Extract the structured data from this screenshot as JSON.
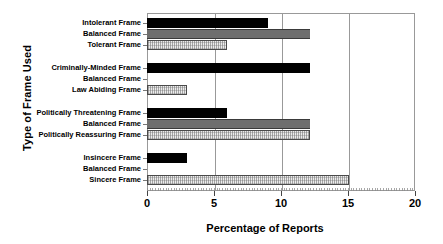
{
  "chart_data": {
    "type": "bar",
    "orientation": "horizontal",
    "title": "",
    "xlabel": "Percentage of Reports",
    "ylabel": "Type of Frame Used",
    "xlim": [
      0,
      20
    ],
    "xticks": [
      0,
      5,
      10,
      15,
      20
    ],
    "xtick_labels": [
      "0",
      "5",
      "10",
      "15",
      "20"
    ],
    "grid": true,
    "grid_axis": "x",
    "legend": "none",
    "categories": [
      "Intolerant Frame",
      "Balanced Frame",
      "Tolerant Frame",
      "Criminally-Minded Frame",
      "Balanced Frame",
      "Law Abiding Frame",
      "Politically Threatening Frame",
      "Balanced Frame",
      "Politically Reassuring Frame",
      "Insincere  Frame",
      "Balanced Frame",
      "Sincere Frame"
    ],
    "values": [
      9.0,
      12.2,
      6.0,
      12.2,
      0.0,
      3.0,
      6.0,
      12.2,
      12.2,
      3.0,
      0.0,
      15.1
    ],
    "bars": [
      {
        "label": "Intolerant Frame",
        "value": 9.0,
        "style": "solid-black",
        "group": 1
      },
      {
        "label": "Balanced Frame",
        "value": 12.2,
        "style": "solid-gray",
        "group": 1
      },
      {
        "label": "Tolerant Frame",
        "value": 6.0,
        "style": "hatched-light",
        "group": 1
      },
      {
        "label": "Criminally-Minded Frame",
        "value": 12.2,
        "style": "solid-black",
        "group": 2
      },
      {
        "label": "Balanced Frame",
        "value": 0.0,
        "style": "solid-gray",
        "group": 2
      },
      {
        "label": "Law Abiding Frame",
        "value": 3.0,
        "style": "hatched-light",
        "group": 2
      },
      {
        "label": "Politically Threatening Frame",
        "value": 6.0,
        "style": "solid-black",
        "group": 3
      },
      {
        "label": "Balanced Frame",
        "value": 12.2,
        "style": "solid-gray",
        "group": 3
      },
      {
        "label": "Politically Reassuring Frame",
        "value": 12.2,
        "style": "hatched-light",
        "group": 3
      },
      {
        "label": "Insincere  Frame",
        "value": 3.0,
        "style": "solid-black",
        "group": 4
      },
      {
        "label": "Balanced Frame",
        "value": 0.0,
        "style": "solid-gray",
        "group": 4
      },
      {
        "label": "Sincere Frame",
        "value": 15.1,
        "style": "hatched-light",
        "group": 4
      }
    ],
    "colors": {
      "solid_black": "#000000",
      "solid_gray": "#6e6e6e",
      "hatched_light": "#ececec",
      "axis": "#999999",
      "text": "#000000"
    }
  }
}
